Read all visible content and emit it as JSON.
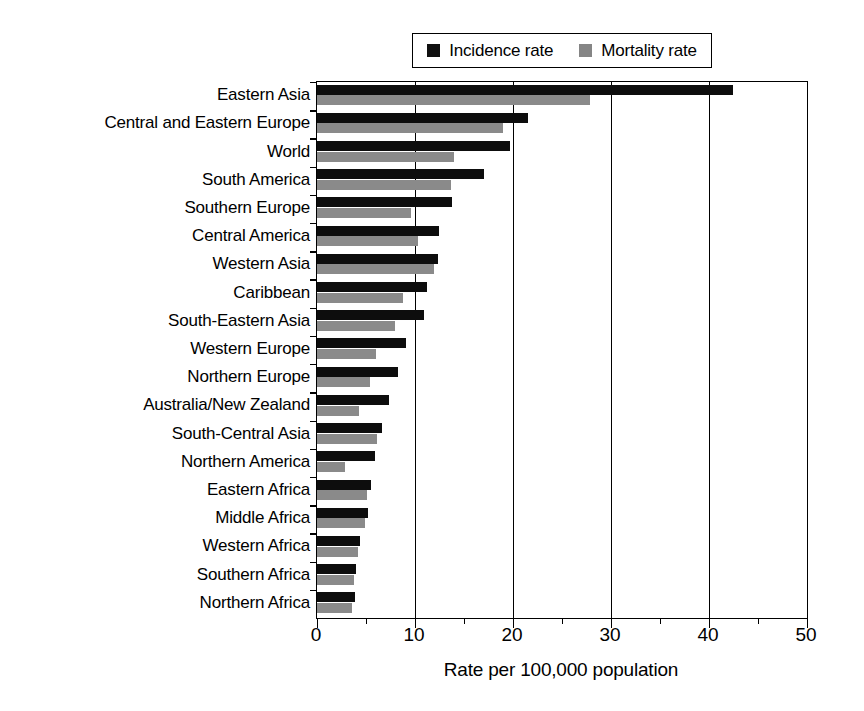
{
  "chart_data": {
    "type": "bar",
    "orientation": "horizontal",
    "title": "",
    "xlabel": "Rate per 100,000 population",
    "ylabel": "",
    "xlim": [
      0,
      50
    ],
    "xticks": [
      0,
      10,
      20,
      30,
      40,
      50
    ],
    "xtick_labels": [
      "0",
      "10",
      "20",
      "30",
      "40",
      "50"
    ],
    "xminor_ticks": [
      5,
      15,
      25,
      35,
      45
    ],
    "grid": "vertical-major",
    "legend_position": "top-center",
    "categories": [
      "Eastern Asia",
      "Central and Eastern Europe",
      "World",
      "South America",
      "Southern Europe",
      "Central America",
      "Western Asia",
      "Caribbean",
      "South-Eastern Asia",
      "Western Europe",
      "Northern Europe",
      "Australia/New Zealand",
      "South-Central Asia",
      "Northern America",
      "Eastern Africa",
      "Middle Africa",
      "Western Africa",
      "Southern Africa",
      "Northern Africa"
    ],
    "series": [
      {
        "name": "Incidence rate",
        "color": "#0d0d0d",
        "values": [
          42.4,
          21.5,
          19.7,
          17.0,
          13.8,
          12.4,
          12.3,
          11.2,
          10.9,
          9.1,
          8.3,
          7.3,
          6.6,
          5.9,
          5.5,
          5.2,
          4.4,
          4.0,
          3.9
        ]
      },
      {
        "name": "Mortality rate",
        "color": "#8a8a8a",
        "values": [
          27.9,
          19.0,
          14.0,
          13.7,
          9.6,
          10.3,
          11.9,
          8.8,
          8.0,
          6.0,
          5.4,
          4.3,
          6.1,
          2.9,
          5.1,
          4.9,
          4.2,
          3.8,
          3.6
        ]
      }
    ]
  },
  "legend": {
    "entries": [
      {
        "label": "Incidence rate",
        "swatch": "black-square-icon"
      },
      {
        "label": "Mortality rate",
        "swatch": "gray-square-icon"
      }
    ]
  }
}
